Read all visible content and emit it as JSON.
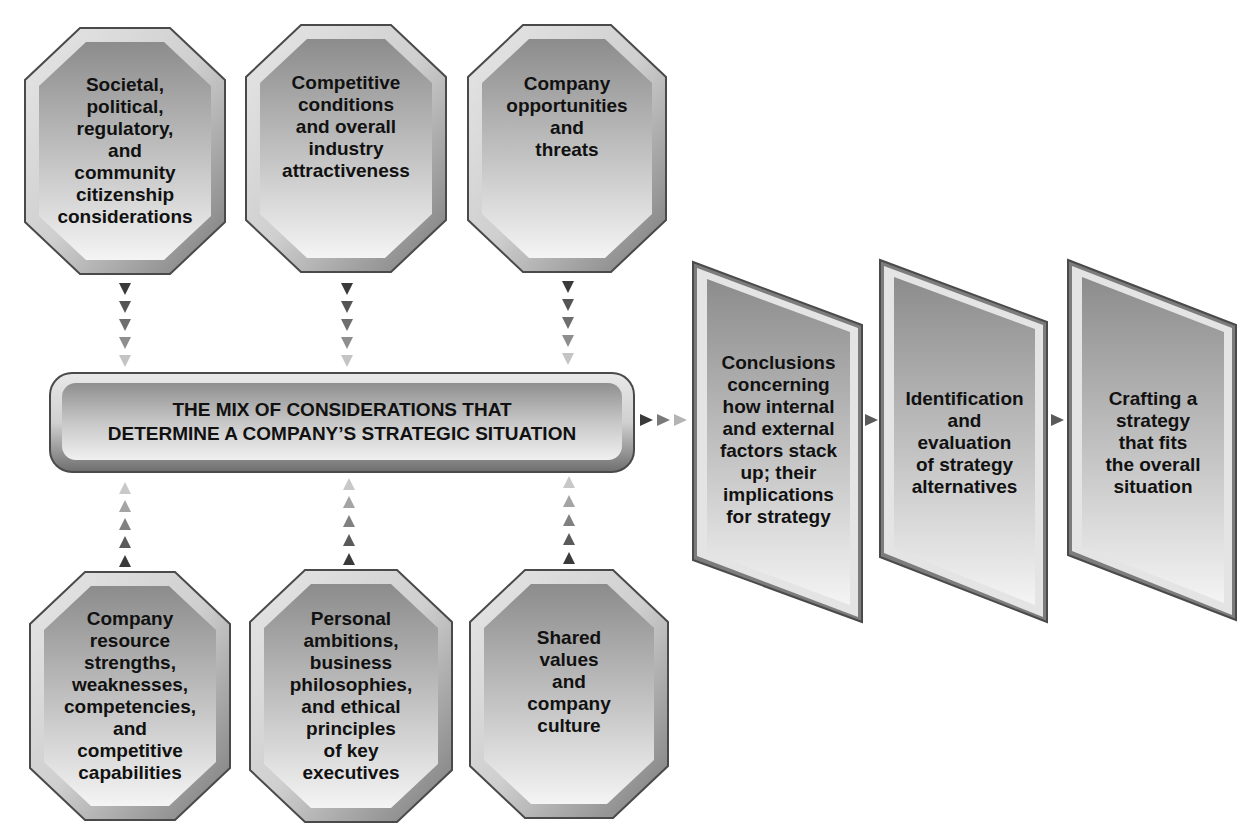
{
  "colors": {
    "border": "#4a4a4a",
    "frame_light": "#d8d8d8",
    "fill_top": "#8e8e8e",
    "fill_bottom": "#f2f2f2",
    "arrow_dark": "#3a3a3a",
    "arrow_light": "#c8c8c8",
    "text": "#111111"
  },
  "top_factors": [
    {
      "label": "Societal,\npolitical,\nregulatory,\nand\ncommunity\ncitizenship\nconsiderations"
    },
    {
      "label": "Competitive\nconditions\nand overall\nindustry\nattractiveness"
    },
    {
      "label": "Company\nopportunities\nand\nthreats"
    }
  ],
  "center_bar": {
    "label": "THE MIX OF CONSIDERATIONS THAT\nDETERMINE A COMPANY’S STRATEGIC SITUATION"
  },
  "bottom_factors": [
    {
      "label": "Company\nresource\nstrengths,\nweaknesses,\ncompetencies,\nand\ncompetitive\ncapabilities"
    },
    {
      "label": "Personal\nambitions,\nbusiness\nphilosophies,\nand ethical\nprinciples\nof key\nexecutives"
    },
    {
      "label": "Shared\nvalues\nand\ncompany\nculture"
    }
  ],
  "process_steps": [
    {
      "label": "Conclusions\nconcerning\nhow internal\nand external\nfactors stack\nup; their\nimplications\nfor strategy"
    },
    {
      "label": "Identification\nand\nevaluation\nof strategy\nalternatives"
    },
    {
      "label": "Crafting a\nstrategy\nthat fits\nthe overall\nsituation"
    }
  ]
}
